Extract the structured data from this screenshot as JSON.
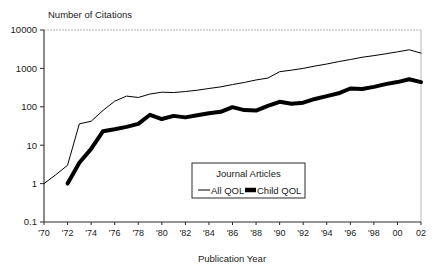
{
  "chart_data": {
    "type": "line",
    "title": "",
    "ylabel": "Number of Citations",
    "xlabel": "Publication Year",
    "yscale": "log",
    "ylim": [
      0.1,
      10000
    ],
    "xlim": [
      1970,
      2002
    ],
    "grid": false,
    "legend_position": "inside-center-right",
    "legend_title": "Journal Articles",
    "ytick_labels": [
      "10000",
      "1000",
      "100",
      "10",
      "1",
      "0.1"
    ],
    "ytick_values": [
      10000,
      1000,
      100,
      10,
      1,
      0.1
    ],
    "xtick_labels": [
      "'70",
      "'72",
      "'74",
      "'76",
      "'78",
      "'80",
      "'82",
      "'84",
      "'86",
      "'88",
      "'90",
      "'92",
      "'94",
      "'96",
      "'98",
      "00",
      "02"
    ],
    "xtick_values": [
      1970,
      1972,
      1974,
      1976,
      1978,
      1980,
      1982,
      1984,
      1986,
      1988,
      1990,
      1992,
      1994,
      1996,
      1998,
      2000,
      2002
    ],
    "x": [
      1970,
      1971,
      1972,
      1973,
      1974,
      1975,
      1976,
      1977,
      1978,
      1979,
      1980,
      1981,
      1982,
      1983,
      1984,
      1985,
      1986,
      1987,
      1988,
      1989,
      1990,
      1991,
      1992,
      1993,
      1994,
      1995,
      1996,
      1997,
      1998,
      1999,
      2000,
      2001,
      2002
    ],
    "series": [
      {
        "name": "All QOL",
        "style": "thin",
        "color": "#000000",
        "linewidth": 1,
        "x": [
          1970,
          1971,
          1972,
          1973,
          1974,
          1975,
          1976,
          1977,
          1978,
          1979,
          1980,
          1981,
          1982,
          1983,
          1984,
          1985,
          1986,
          1987,
          1988,
          1989,
          1990,
          1991,
          1992,
          1993,
          1994,
          1995,
          1996,
          1997,
          1998,
          1999,
          2000,
          2001,
          2002
        ],
        "values": [
          1,
          1.7,
          3,
          36,
          42,
          80,
          140,
          190,
          175,
          215,
          240,
          235,
          250,
          270,
          300,
          330,
          380,
          430,
          500,
          560,
          820,
          900,
          1000,
          1150,
          1300,
          1500,
          1700,
          1950,
          2150,
          2400,
          2700,
          3050,
          2500
        ]
      },
      {
        "name": "Child QOL",
        "style": "thick",
        "color": "#000000",
        "linewidth": 4,
        "x": [
          1972,
          1973,
          1974,
          1975,
          1976,
          1977,
          1978,
          1979,
          1980,
          1981,
          1982,
          1983,
          1984,
          1985,
          1986,
          1987,
          1988,
          1989,
          1990,
          1991,
          1992,
          1993,
          1994,
          1995,
          1996,
          1997,
          1998,
          1999,
          2000,
          2001,
          2002
        ],
        "values": [
          1,
          3.5,
          8,
          23,
          26,
          30,
          36,
          62,
          48,
          58,
          53,
          60,
          68,
          74,
          98,
          82,
          80,
          105,
          135,
          120,
          128,
          160,
          190,
          225,
          300,
          290,
          330,
          390,
          440,
          520,
          440
        ]
      }
    ]
  },
  "axes": {
    "ylabel_text": "Number of Citations",
    "xlabel_text": "Publication Year"
  },
  "legend": {
    "title": "Journal Articles",
    "items": [
      {
        "label": "All QOL",
        "marker": "thin-line-swatch"
      },
      {
        "label": "Child QOL",
        "marker": "thick-line-swatch"
      }
    ]
  },
  "colors": {
    "axis": "#333333",
    "line": "#000000",
    "frame_faint": "#b0b0b0",
    "background": "#ffffff"
  }
}
